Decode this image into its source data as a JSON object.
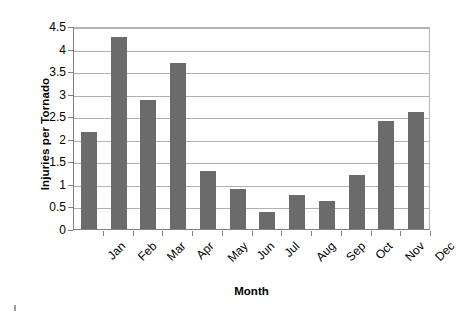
{
  "chart_data": {
    "type": "bar",
    "title": "",
    "xlabel": "Month",
    "ylabel": "Injuries per Tornado",
    "categories": [
      "Jan",
      "Feb",
      "Mar",
      "Apr",
      "May",
      "Jun",
      "Jul",
      "Aug",
      "Sep",
      "Oct",
      "Nov",
      "Dec"
    ],
    "values": [
      2.15,
      4.26,
      2.86,
      3.67,
      1.28,
      0.88,
      0.37,
      0.75,
      0.62,
      1.19,
      2.39,
      2.6
    ],
    "series": [
      {
        "name": "Injuries per Tornado",
        "values": [
          2.15,
          4.26,
          2.86,
          3.67,
          1.28,
          0.88,
          0.37,
          0.75,
          0.62,
          1.19,
          2.39,
          2.6
        ]
      }
    ],
    "ylim": [
      0,
      4.5
    ],
    "y_ticks": [
      0,
      0.5,
      1,
      1.5,
      2,
      2.5,
      3,
      3.5,
      4,
      4.5
    ],
    "y_tick_labels": [
      "0",
      "0.5",
      "1",
      "1.5",
      "2",
      "2.5",
      "3",
      "3.5",
      "4",
      "4.5"
    ],
    "grid": "horizontal",
    "legend": "none",
    "bar_color": "#6b6b6b",
    "gridline_color": "#b0b0b0",
    "axis_color": "#808080",
    "background_color": "#ffffff",
    "x_label_rotation": -45
  }
}
